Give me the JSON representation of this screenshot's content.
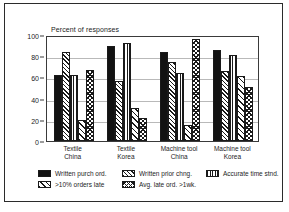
{
  "chart_data": {
    "type": "bar",
    "title": "Percent of responses",
    "xlabel": "",
    "ylabel": "Percent of responses",
    "ylim": [
      0,
      100
    ],
    "yticks": [
      0,
      20,
      40,
      60,
      80,
      100
    ],
    "grid": true,
    "legend_position": "bottom",
    "categories": [
      "Textile\nChina",
      "Textile\nKorea",
      "Machine tool\nChina",
      "Machine tool\nKorea"
    ],
    "category_lines": [
      [
        "Textile",
        "China"
      ],
      [
        "Textile",
        "Korea"
      ],
      [
        "Machine tool",
        "China"
      ],
      [
        "Machine tool",
        "Korea"
      ]
    ],
    "series": [
      {
        "name": "Written purch ord.",
        "pattern": "solid",
        "values": [
          62,
          90,
          84,
          86
        ]
      },
      {
        "name": "Written prior chng.",
        "pattern": "diagonal-hatch",
        "values": [
          84,
          57,
          75,
          66
        ]
      },
      {
        "name": "Accurate time stnd.",
        "pattern": "vertical-lines",
        "values": [
          62,
          92,
          64,
          81
        ]
      },
      {
        "name": ">10% orders late",
        "pattern": "light-diagonal",
        "values": [
          20,
          31,
          15,
          61
        ]
      },
      {
        "name": "Avg. late ord. >1wk.",
        "pattern": "checkered",
        "values": [
          67,
          22,
          96,
          51
        ]
      }
    ]
  },
  "colors": {
    "frame": "#2b2b2b",
    "axis": "#3a3a3a",
    "gridline": "#b9b9b9",
    "bar_outline": "#1a1a1a",
    "text": "#1c1c1c",
    "background": "#ffffff"
  }
}
